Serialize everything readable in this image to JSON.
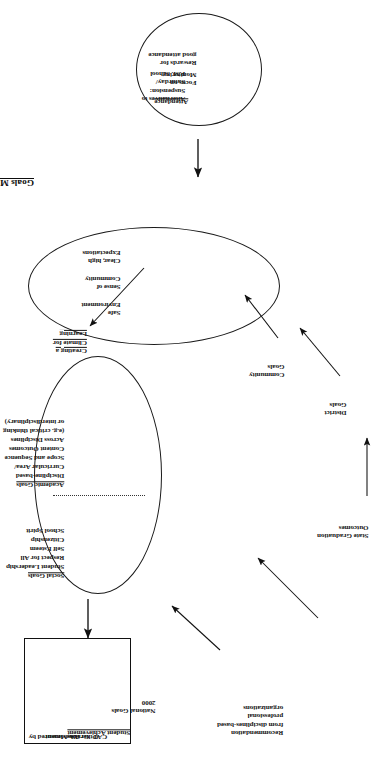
{
  "document": {
    "title": "Goals Map",
    "orientation": "rotated-90-ccw"
  },
  "title_block": {
    "text": "Goals Map"
  },
  "inputs": {
    "state_graduation_outcomes": "State Graduation\nOutcomes",
    "recommendation": "Recommendation\nfrom disciplines-based\nprofessional\norganizations",
    "national_goals": "National Goals\n2000",
    "district_goals": "District\nGoals",
    "community_goals": "Community\nGoals"
  },
  "goals_ellipse": {
    "social": {
      "heading": "Social Goals",
      "items": [
        "Student Leadership",
        "Respect for All",
        "Self Esteem",
        "Citizenship",
        "School Spirit"
      ]
    },
    "academic": {
      "heading": "Academic Goals",
      "items": [
        "Discipline-based",
        "Curricular Area/",
        "Scope and Sequence",
        "Content Outcomes",
        "Across Disciplines",
        "(e.g. critical thinking",
        "or interdisciplinary)"
      ]
    }
  },
  "climate_ellipse": {
    "heading": "Creating a\nClimate for\nLearning",
    "items": [
      "Safe\nEnvironment",
      "Sense of\nCommunity",
      "Clear, high\nExpectations"
    ]
  },
  "attendance_circle": {
    "heading": "Attendance",
    "column_left": [
      "Focus on\nMonitoring",
      "Rewards for\ngood attendance"
    ],
    "column_right": [
      "Alternatives to\nSuspension:\nSaturday/\nP.M. School"
    ]
  },
  "outcome_box": {
    "heading": "Student Achievement",
    "measured_by_label": "Measured by",
    "measures": [
      "OA",
      "Grades",
      "Other Assessment",
      "CAT"
    ]
  },
  "colors": {
    "ink": "#111111",
    "page": "#ffffff",
    "stroke": "#1a1a1a"
  }
}
